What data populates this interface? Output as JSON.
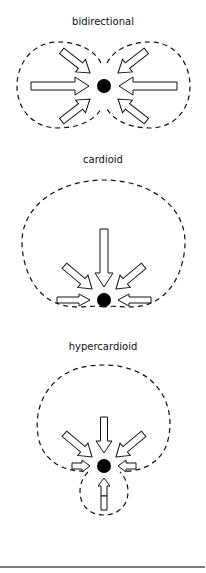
{
  "figure": {
    "patterns": [
      {
        "name": "bidirectional",
        "label": "bidirectional",
        "pickup_directions": [
          "front",
          "rear",
          "front-upper",
          "front-lower",
          "rear-upper",
          "rear-lower"
        ],
        "rejection": "sides (90°)"
      },
      {
        "name": "cardioid",
        "label": "cardioid",
        "pickup_directions": [
          "front",
          "front-left",
          "front-right",
          "left",
          "right"
        ],
        "rejection": "rear (180°)"
      },
      {
        "name": "hypercardioid",
        "label": "hypercardioid",
        "pickup_directions": [
          "front",
          "front-left",
          "front-right",
          "left",
          "right",
          "rear"
        ],
        "rejection": "sides-rear, small rear lobe"
      }
    ]
  },
  "colors": {
    "outline": "#111111",
    "arrow_fill": "#ffffff",
    "mic_dot": "#000000",
    "rule": "#7a7a7a"
  }
}
